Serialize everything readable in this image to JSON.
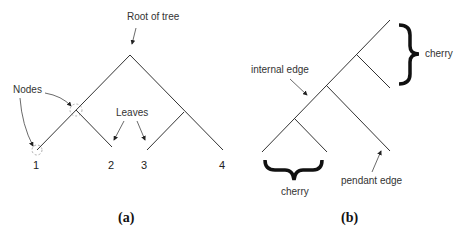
{
  "panel_a": {
    "caption": "(a)",
    "labels": {
      "root": "Root  of tree",
      "nodes": "Nodes",
      "leaves": "Leaves"
    },
    "leaf_numbers": [
      "1",
      "2",
      "3",
      "4"
    ]
  },
  "panel_b": {
    "caption": "(b)",
    "labels": {
      "internal_edge": "internal edge",
      "cherry_top": "cherry",
      "cherry_bottom": "cherry",
      "pendant_edge": "pendant edge"
    }
  },
  "colors": {
    "line": "#333333",
    "text": "#333333",
    "background": "#ffffff"
  }
}
